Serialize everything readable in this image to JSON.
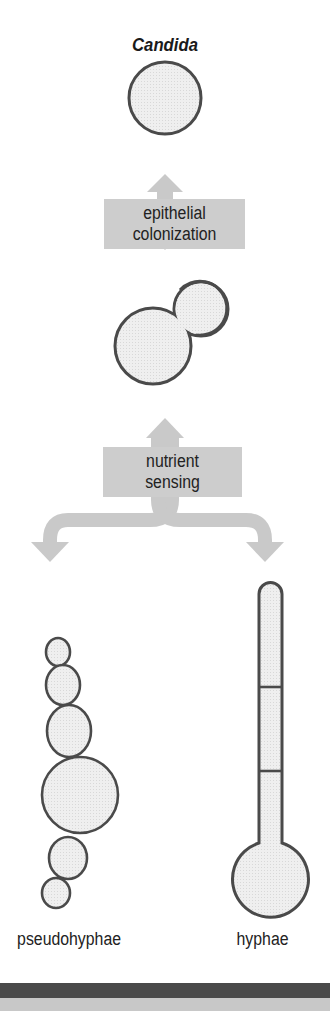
{
  "title": "Candida",
  "steps": [
    {
      "label_line1": "epithelial",
      "label_line2": "colonization",
      "arrow": "bidirectional"
    },
    {
      "label_line1": "nutrient",
      "label_line2": "sensing",
      "arrow": "branching"
    }
  ],
  "forms": {
    "yeast": "yeast cell",
    "budding": "budding yeast",
    "left": "pseudohyphae",
    "right": "hyphae"
  },
  "colors": {
    "cell_fill": "#ececec",
    "cell_stroke": "#4a4a4a",
    "arrow": "#c9c9c9",
    "box": "#cdcdcd",
    "bar_dark": "#4a4a4a",
    "bar_light": "#c8c8c8"
  }
}
